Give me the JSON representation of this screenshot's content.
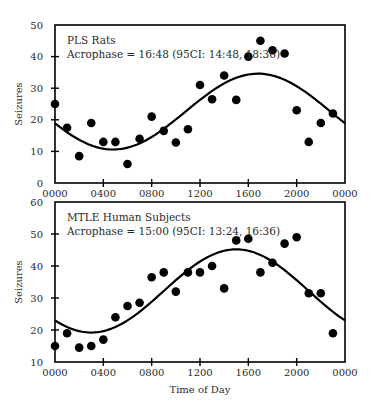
{
  "figure": {
    "xlabel": "Time of Day",
    "colors": {
      "ink": "#000000",
      "text": "#2b2b2b",
      "background": "#ffffff"
    }
  },
  "chart_data": [
    {
      "type": "scatter",
      "title": "PLS Rats",
      "subtitle": "Acrophase = 16:48 (95CI: 14:48, 18:36)",
      "xlabel": "",
      "ylabel": "Seizures",
      "x_tick_labels": [
        "0000",
        "0400",
        "0800",
        "1200",
        "1600",
        "2000",
        "0000"
      ],
      "x_ticks_hours": [
        0,
        4,
        8,
        12,
        16,
        20,
        24
      ],
      "xlim": [
        0,
        24
      ],
      "ylim": [
        0,
        50
      ],
      "y_ticks": [
        0,
        10,
        20,
        30,
        40,
        50
      ],
      "grid": false,
      "legend": null,
      "series": [
        {
          "name": "Observed seizures",
          "kind": "points",
          "x": [
            0,
            1,
            2,
            3,
            4,
            5,
            6,
            7,
            8,
            9,
            10,
            11,
            12,
            13,
            14,
            15,
            16,
            17,
            18,
            19,
            20,
            21,
            22,
            23
          ],
          "values": [
            25,
            17.5,
            8.5,
            19,
            13,
            13,
            6,
            14,
            21,
            16.5,
            12.8,
            17,
            31,
            26.5,
            34,
            26.3,
            40,
            45,
            42,
            41,
            23,
            13,
            19,
            22
          ]
        },
        {
          "name": "Cosinor fit",
          "kind": "curve",
          "mesor": 22.6,
          "amplitude": 12,
          "acrophase_hours": 16.8,
          "period_hours": 24
        }
      ]
    },
    {
      "type": "scatter",
      "title": "MTLE Human Subjects",
      "subtitle": "Acrophase = 15:00 (95CI: 13:24, 16:36)",
      "xlabel": "Time of Day",
      "ylabel": "Seizures",
      "x_tick_labels": [
        "0000",
        "0400",
        "0800",
        "1200",
        "1600",
        "2000",
        "0000"
      ],
      "x_ticks_hours": [
        0,
        4,
        8,
        12,
        16,
        20,
        24
      ],
      "xlim": [
        0,
        24
      ],
      "ylim": [
        10,
        60
      ],
      "y_ticks": [
        10,
        20,
        30,
        40,
        50,
        60
      ],
      "grid": false,
      "legend": null,
      "series": [
        {
          "name": "Observed seizures",
          "kind": "points",
          "x": [
            0,
            1,
            2,
            3,
            4,
            5,
            6,
            7,
            8,
            9,
            10,
            11,
            12,
            13,
            14,
            15,
            16,
            17,
            18,
            19,
            20,
            21,
            22,
            23
          ],
          "values": [
            15,
            19,
            14.5,
            15,
            17,
            24,
            27.5,
            28.5,
            36.5,
            38,
            32,
            38,
            38,
            40,
            33,
            48,
            48.5,
            38,
            41,
            47,
            49,
            31.5,
            31.5,
            19
          ]
        },
        {
          "name": "Cosinor fit",
          "kind": "curve",
          "mesor": 32.2,
          "amplitude": 13,
          "acrophase_hours": 15.0,
          "period_hours": 24
        }
      ]
    }
  ]
}
